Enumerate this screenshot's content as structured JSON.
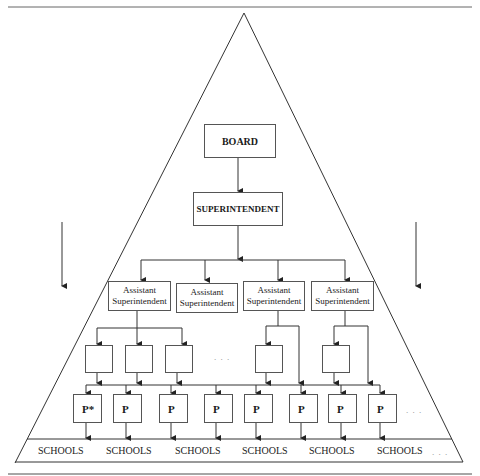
{
  "diagram": {
    "board_label": "BOARD",
    "superintendent_label": "SUPERINTENDENT",
    "assistants": [
      {
        "line1": "Assistant",
        "line2": "Superintendent"
      },
      {
        "line1": "Assistant",
        "line2": "Superintendent"
      },
      {
        "line1": "Assistant",
        "line2": "Superintendent"
      },
      {
        "line1": "Assistant",
        "line2": "Superintendent"
      }
    ],
    "principals": [
      "P*",
      "P",
      "P",
      "P",
      "P",
      "P",
      "P",
      "P"
    ],
    "schools": [
      "SCHOOLS",
      "SCHOOLS",
      "SCHOOLS",
      "SCHOOLS",
      "SCHOOLS",
      "SCHOOLS"
    ],
    "ellipsis": ". . .",
    "colors": {
      "line": "#333333",
      "box_border": "#555555",
      "text": "#1a1a1a"
    }
  }
}
